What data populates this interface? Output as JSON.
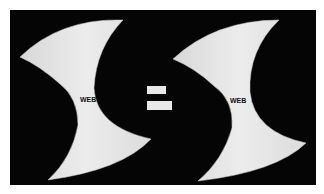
{
  "figure": {
    "background_color": "#050505",
    "shape_color": "#e4e4e4",
    "left_shape": {
      "label": "WEB"
    },
    "operator": {
      "symbol": "="
    },
    "right_shape": {
      "label": "WEB"
    }
  }
}
